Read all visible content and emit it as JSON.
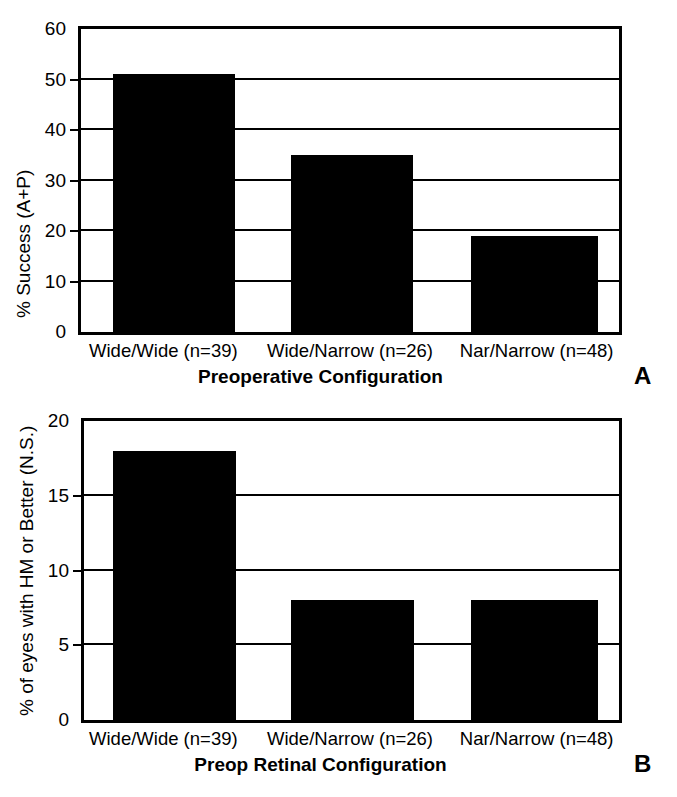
{
  "chart_data": [
    {
      "type": "bar",
      "panel": "A",
      "title": "",
      "categories": [
        "Wide/Wide (n=39)",
        "Wide/Narrow (n=26)",
        "Nar/Narrow (n=48)"
      ],
      "values": [
        51,
        35,
        19
      ],
      "xlabel": "Preoperative Configuration",
      "ylabel": "% Success (A+P)",
      "ylim": [
        0,
        60
      ],
      "yticks": [
        0,
        10,
        20,
        30,
        40,
        50,
        60
      ],
      "ytick_labels": [
        "0",
        "10",
        "20",
        "30",
        "40",
        "50",
        "60"
      ],
      "grid": true,
      "legend": "none",
      "bar_color": "#000000"
    },
    {
      "type": "bar",
      "panel": "B",
      "title": "",
      "categories": [
        "Wide/Wide (n=39)",
        "Wide/Narrow (n=26)",
        "Nar/Narrow (n=48)"
      ],
      "values": [
        18,
        8,
        8
      ],
      "xlabel": "Preop Retinal Configuration",
      "ylabel": "% of eyes with HM or Better (N.S.)",
      "ylim": [
        0,
        20
      ],
      "yticks": [
        0,
        5,
        10,
        15,
        20
      ],
      "ytick_labels": [
        "0",
        "5",
        "10",
        "15",
        "20"
      ],
      "grid": true,
      "legend": "none",
      "bar_color": "#000000"
    }
  ]
}
